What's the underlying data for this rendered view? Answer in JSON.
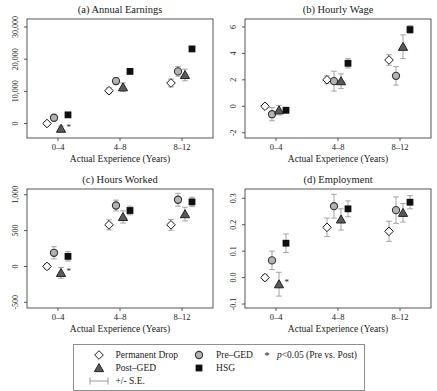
{
  "figure": {
    "background": "#ffffff"
  },
  "style": {
    "axis_color": "#444444",
    "error_bar_color": "#9a9a9a",
    "diamond_fill": "#ffffff",
    "diamond_stroke": "#1a1a1a",
    "circle_fill": "#b3b3b3",
    "circle_stroke": "#333333",
    "triangle_fill": "#5a5a5a",
    "triangle_stroke": "#222222",
    "square_fill": "#0f0f0f"
  },
  "chart_data": [
    {
      "type": "scatter",
      "title": "(a) Annual Earnings",
      "xlabel": "Actual Experience (Years)",
      "categories": [
        "0–4",
        "4–8",
        "8–12"
      ],
      "ylim": [
        -4500,
        32500
      ],
      "yticks": [
        0,
        10000,
        20000,
        30000
      ],
      "ytick_labels": [
        "0",
        "10,000",
        "20,000",
        "30,000"
      ],
      "grid": false,
      "series": [
        {
          "name": "Permanent Drop",
          "marker": "diamond",
          "values": [
            0,
            10200,
            12600
          ],
          "se": [
            600,
            900,
            1200
          ],
          "star": [
            false,
            false,
            false
          ]
        },
        {
          "name": "Pre-GED",
          "marker": "circle",
          "values": [
            1800,
            13200,
            16200
          ],
          "se": [
            800,
            1100,
            1500
          ],
          "star": [
            false,
            false,
            false
          ]
        },
        {
          "name": "Post-GED",
          "marker": "triangle",
          "values": [
            -1600,
            11300,
            15100
          ],
          "se": [
            800,
            1300,
            1800
          ],
          "star": [
            true,
            false,
            false
          ]
        },
        {
          "name": "HSG",
          "marker": "square",
          "values": [
            2700,
            16200,
            23200
          ],
          "se": [
            400,
            600,
            700
          ],
          "star": [
            false,
            false,
            false
          ]
        }
      ]
    },
    {
      "type": "scatter",
      "title": "(b) Hourly Wage",
      "xlabel": "Actual Experience (Years)",
      "categories": [
        "0–4",
        "4–8",
        "8–12"
      ],
      "ylim": [
        -2.4,
        6.6
      ],
      "yticks": [
        -2,
        0,
        2,
        4,
        6
      ],
      "ytick_labels": [
        "-2",
        "0",
        "2",
        "4",
        "6"
      ],
      "grid": false,
      "series": [
        {
          "name": "Permanent Drop",
          "marker": "diamond",
          "values": [
            0.0,
            2.0,
            3.5
          ],
          "se": [
            0.15,
            0.3,
            0.4
          ],
          "star": [
            false,
            false,
            false
          ]
        },
        {
          "name": "Pre-GED",
          "marker": "circle",
          "values": [
            -0.6,
            1.9,
            2.3
          ],
          "se": [
            0.5,
            0.75,
            0.7
          ],
          "star": [
            false,
            false,
            false
          ]
        },
        {
          "name": "Post-GED",
          "marker": "triangle",
          "values": [
            -0.3,
            1.9,
            4.5
          ],
          "se": [
            0.35,
            0.55,
            0.9
          ],
          "star": [
            false,
            false,
            false
          ]
        },
        {
          "name": "HSG",
          "marker": "square",
          "values": [
            -0.3,
            3.25,
            5.8
          ],
          "se": [
            0.2,
            0.35,
            0.3
          ],
          "star": [
            false,
            false,
            false
          ]
        }
      ]
    },
    {
      "type": "scatter",
      "title": "(c) Hours Worked",
      "xlabel": "Actual Experience (Years)",
      "categories": [
        "0–4",
        "4–8",
        "8–12"
      ],
      "ylim": [
        -580,
        1080
      ],
      "yticks": [
        -500,
        0,
        500,
        1000
      ],
      "ytick_labels": [
        "-500",
        "0",
        "500",
        "1,000"
      ],
      "grid": false,
      "series": [
        {
          "name": "Permanent Drop",
          "marker": "diamond",
          "values": [
            0,
            580,
            580
          ],
          "se": [
            40,
            70,
            75
          ],
          "star": [
            false,
            false,
            false
          ]
        },
        {
          "name": "Pre-GED",
          "marker": "circle",
          "values": [
            190,
            850,
            930
          ],
          "se": [
            85,
            75,
            90
          ],
          "star": [
            false,
            false,
            false
          ]
        },
        {
          "name": "Post-GED",
          "marker": "triangle",
          "values": [
            -90,
            690,
            730
          ],
          "se": [
            75,
            85,
            95
          ],
          "star": [
            true,
            false,
            false
          ]
        },
        {
          "name": "HSG",
          "marker": "square",
          "values": [
            140,
            780,
            900
          ],
          "se": [
            65,
            60,
            65
          ],
          "star": [
            false,
            false,
            false
          ]
        }
      ]
    },
    {
      "type": "scatter",
      "title": "(d) Employment",
      "xlabel": "Actual Experience (Years)",
      "categories": [
        "0–4",
        "4–8",
        "8–12"
      ],
      "ylim": [
        -0.115,
        0.335
      ],
      "yticks": [
        -0.1,
        0.0,
        0.1,
        0.2,
        0.3
      ],
      "ytick_labels": [
        "-0.1",
        "0.0",
        "0.1",
        "0.2",
        "0.3"
      ],
      "grid": false,
      "series": [
        {
          "name": "Permanent Drop",
          "marker": "diamond",
          "values": [
            0.0,
            0.19,
            0.175
          ],
          "se": [
            0.012,
            0.035,
            0.038
          ],
          "star": [
            false,
            false,
            false
          ]
        },
        {
          "name": "Pre-GED",
          "marker": "circle",
          "values": [
            0.065,
            0.27,
            0.255
          ],
          "se": [
            0.035,
            0.045,
            0.05
          ],
          "star": [
            false,
            false,
            false
          ]
        },
        {
          "name": "Post-GED",
          "marker": "triangle",
          "values": [
            -0.025,
            0.22,
            0.245
          ],
          "se": [
            0.045,
            0.04,
            0.035
          ],
          "star": [
            true,
            false,
            false
          ]
        },
        {
          "name": "HSG",
          "marker": "square",
          "values": [
            0.13,
            0.26,
            0.285
          ],
          "se": [
            0.035,
            0.03,
            0.025
          ],
          "star": [
            false,
            false,
            false
          ]
        }
      ]
    }
  ],
  "legend": {
    "items": [
      {
        "marker": "diamond",
        "label": "Permanent Drop"
      },
      {
        "marker": "triangle",
        "label": "Post–GED"
      },
      {
        "marker": "errorbar",
        "label": "+/- S.E."
      },
      {
        "marker": "circle",
        "label": "Pre–GED"
      },
      {
        "marker": "square",
        "label": "HSG"
      }
    ],
    "sig": {
      "star": "*",
      "p": "p",
      "rest": "<0.05 (Pre vs. Post)"
    }
  }
}
